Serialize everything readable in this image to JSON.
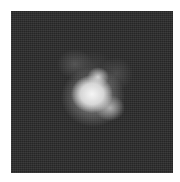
{
  "image": {
    "description": "Grayscale fluorescence-style micrograph: dark noisy square field with a bright irregular blob near the center",
    "colors": {
      "background": "#ffffff",
      "field": "#2a2a2a",
      "blob_core": "#f5f5f5"
    }
  }
}
